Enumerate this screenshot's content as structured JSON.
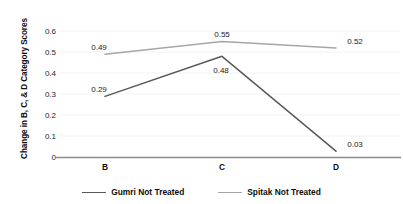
{
  "chart_data": {
    "type": "line",
    "title": "",
    "xlabel": "",
    "ylabel": "Change in B, C, & D Category Scores",
    "categories": [
      "B",
      "C",
      "D"
    ],
    "series": [
      {
        "name": "Gumri Not Treated",
        "color": "#595959",
        "values": [
          0.29,
          0.48,
          0.03
        ],
        "labels": [
          "0.29",
          "0.48",
          "0.03"
        ]
      },
      {
        "name": "Spitak Not Treated",
        "color": "#a6a6a6",
        "values": [
          0.49,
          0.55,
          0.52
        ],
        "labels": [
          "0.49",
          "0.55",
          "0.52"
        ]
      }
    ],
    "ylim": [
      0,
      0.6
    ],
    "y_ticks": [
      "0",
      "0.1",
      "0.2",
      "0.3",
      "0.4",
      "0.5",
      "0.6"
    ],
    "grid": true,
    "legend_position": "bottom"
  },
  "axis": {
    "y_ticks": [
      {
        "label": "0.6"
      },
      {
        "label": "0.5"
      },
      {
        "label": "0.4"
      },
      {
        "label": "0.3"
      },
      {
        "label": "0.2"
      },
      {
        "label": "0.1"
      },
      {
        "label": "0"
      }
    ],
    "x_ticks": [
      {
        "label": "B"
      },
      {
        "label": "C"
      },
      {
        "label": "D"
      }
    ],
    "y_title": "Change in B, C, & D Category Scores"
  },
  "labels": {
    "gumri_b": "0.29",
    "gumri_c": "0.48",
    "gumri_d": "0.03",
    "spitak_b": "0.49",
    "spitak_c": "0.55",
    "spitak_d": "0.52"
  },
  "legend": {
    "items": [
      {
        "label": "Gumri Not Treated",
        "color": "#595959"
      },
      {
        "label": "Spitak Not Treated",
        "color": "#a6a6a6"
      }
    ]
  },
  "colors": {
    "gumri": "#595959",
    "spitak": "#a6a6a6",
    "axis": "#808080",
    "grid": "#f0f0f0",
    "text": "#1a1a1a"
  }
}
